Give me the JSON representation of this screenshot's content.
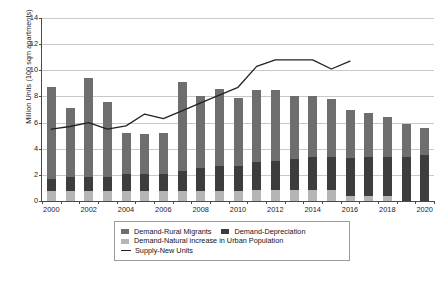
{
  "chart_data": {
    "type": "bar",
    "title": "",
    "subtitle": "",
    "xlabel": "",
    "ylabel": "Million Units (100 sqm apartments)",
    "ylim": [
      0,
      14
    ],
    "yticks": [
      0,
      2,
      4,
      6,
      8,
      10,
      12,
      14
    ],
    "xtick_labels": [
      "2000",
      "2002",
      "2004",
      "2006",
      "2008",
      "2010",
      "2012",
      "2014",
      "2016",
      "2018",
      "2020"
    ],
    "grid": true,
    "legend_position": "bottom",
    "stacked": true,
    "categories": [
      "2000",
      "2001",
      "2002",
      "2003",
      "2004",
      "2005",
      "2006",
      "2007",
      "2008",
      "2009",
      "2010",
      "2011",
      "2012",
      "2013",
      "2014",
      "2015",
      "2016",
      "2017",
      "2018",
      "2019",
      "2020"
    ],
    "series": [
      {
        "name": "Demand-Natural increase in Urban Population",
        "type": "bar",
        "color": "#b5b5b5",
        "values": [
          0.8,
          0.8,
          0.8,
          0.8,
          0.8,
          0.8,
          0.8,
          0.8,
          0.8,
          0.8,
          0.8,
          0.85,
          0.85,
          0.85,
          0.85,
          0.85,
          0.4,
          0.4,
          0.4,
          0.0,
          0.0
        ]
      },
      {
        "name": "Demand-Depreciation",
        "type": "bar",
        "color": "#3d3d3d",
        "values": [
          0.9,
          1.0,
          1.0,
          1.0,
          1.3,
          1.3,
          1.3,
          1.5,
          1.7,
          1.85,
          1.9,
          2.15,
          2.2,
          2.4,
          2.55,
          2.5,
          2.9,
          3.0,
          3.0,
          3.4,
          3.5
        ]
      },
      {
        "name": "Demand-Rural Migrants",
        "type": "bar",
        "color": "#6e6e6e",
        "values": [
          7.0,
          5.3,
          7.6,
          5.8,
          3.1,
          3.0,
          3.1,
          6.8,
          5.5,
          5.95,
          5.2,
          5.5,
          5.45,
          4.8,
          4.6,
          4.45,
          3.7,
          3.3,
          3.0,
          2.5,
          2.1
        ]
      },
      {
        "name": "Supply-New Units",
        "type": "line",
        "color": "#222222",
        "x": [
          "2000",
          "2001",
          "2002",
          "2003",
          "2004",
          "2005",
          "2006",
          "2007",
          "2008",
          "2009",
          "2010",
          "2011",
          "2012",
          "2013",
          "2014",
          "2015",
          "2016"
        ],
        "values": [
          5.5,
          5.7,
          6.0,
          5.5,
          5.75,
          6.65,
          6.3,
          6.9,
          7.5,
          8.1,
          8.7,
          10.3,
          10.8,
          10.8,
          10.8,
          10.1,
          10.7
        ]
      }
    ],
    "bar_totals": [
      8.7,
      7.1,
      9.4,
      7.6,
      5.2,
      5.1,
      5.2,
      9.1,
      8.0,
      8.6,
      7.9,
      8.5,
      8.5,
      8.05,
      8.0,
      7.8,
      7.0,
      6.7,
      6.4,
      5.9,
      5.6
    ]
  },
  "legend": {
    "entries": [
      {
        "label": "Demand-Rural Migrants",
        "marker": "square"
      },
      {
        "label": "Demand-Depreciation",
        "marker": "square"
      },
      {
        "label": "Demand-Natural increase in Urban Population",
        "marker": "square"
      },
      {
        "label": "Supply-New Units",
        "marker": "line"
      }
    ]
  }
}
